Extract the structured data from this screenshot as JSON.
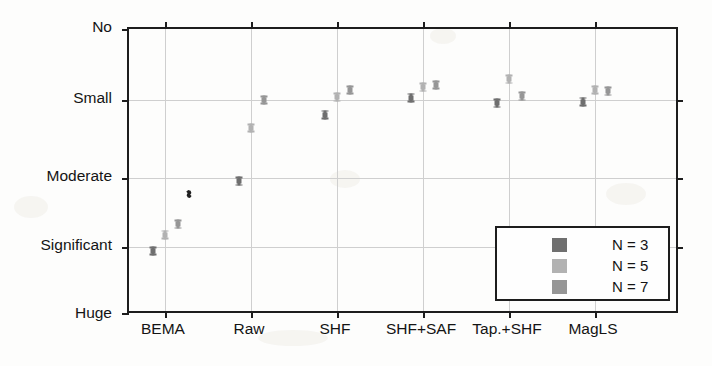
{
  "chart_data": {
    "type": "scatter",
    "title": "",
    "xlabel": "",
    "ylabel": "",
    "categories": [
      "BEMA",
      "Raw",
      "SHF",
      "SHF+SAF",
      "Tap.+SHF",
      "MagLS"
    ],
    "ytick_labels": [
      "No",
      "Small",
      "Moderate",
      "Significant",
      "Huge"
    ],
    "ytick_values": [
      0,
      1,
      2,
      3,
      4
    ],
    "ylim": [
      4.35,
      -0.35
    ],
    "y_axis_direction": "inverted",
    "grid": true,
    "legend_position": "lower right",
    "marker_style": "errorbar-with-caps",
    "series": [
      {
        "name": "N = 3",
        "color": "#6f6f6f",
        "values": [
          3.06,
          2.05,
          1.19,
          0.97,
          1.04,
          1.02
        ],
        "err": [
          0.06,
          0.05,
          0.05,
          0.05,
          0.05,
          0.05
        ]
      },
      {
        "name": "N = 5",
        "color": "#b2b2b2",
        "values": [
          2.82,
          1.36,
          0.96,
          0.82,
          0.71,
          0.86
        ],
        "err": [
          0.06,
          0.05,
          0.05,
          0.05,
          0.05,
          0.05
        ]
      },
      {
        "name": "N = 7",
        "color": "#969696",
        "values": [
          2.67,
          1.0,
          0.86,
          0.79,
          0.95,
          0.88
        ],
        "err": [
          0.06,
          0.05,
          0.05,
          0.05,
          0.05,
          0.05
        ]
      }
    ],
    "annotations": [
      {
        "name": "ink-speck",
        "x": 0.72,
        "y": 2.17
      }
    ]
  },
  "legend": {
    "items": [
      {
        "label": "N = 3",
        "color": "#6f6f6f"
      },
      {
        "label": "N = 5",
        "color": "#b2b2b2"
      },
      {
        "label": "N = 7",
        "color": "#969696"
      }
    ]
  },
  "colors": {
    "axis": "#1d1d1d",
    "grid": "#cfcfcf",
    "background": "#fdfdfc",
    "n3": "#6f6f6f",
    "n5": "#b2b2b2",
    "n7": "#969696"
  }
}
